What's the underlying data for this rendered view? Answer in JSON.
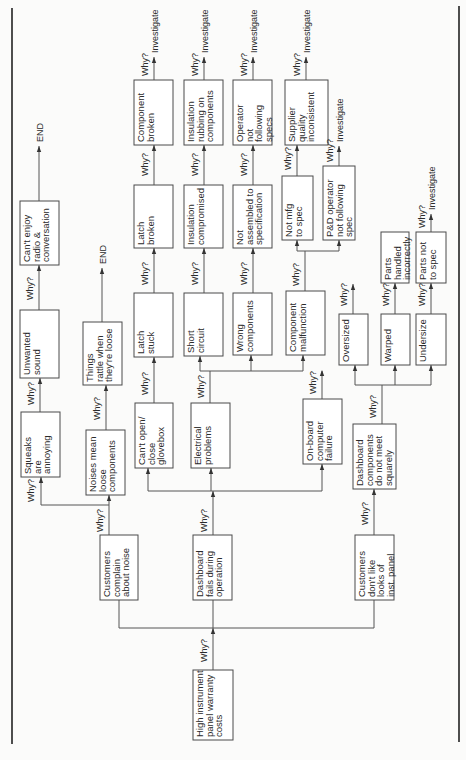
{
  "figure": {
    "why_label": "Why?",
    "colors": {
      "background": "#fbfbfa",
      "line": "#555555",
      "box_border": "#4a4a4a",
      "text": "#2a2a2a"
    },
    "root": {
      "lines": [
        "High instrument",
        "panel warranty",
        "costs"
      ]
    },
    "level1": [
      {
        "id": "noise",
        "lines": [
          "Customers",
          "complain",
          "about noise"
        ]
      },
      {
        "id": "fails",
        "lines": [
          "Dashboard",
          "fails during",
          "operation"
        ]
      },
      {
        "id": "looks",
        "lines": [
          "Customers",
          "don't like",
          "looks of",
          "inst. panel"
        ]
      }
    ],
    "level2": [
      {
        "id": "squeaks",
        "lines": [
          "Squeaks",
          "are",
          "annoying"
        ]
      },
      {
        "id": "noises_loose",
        "lines": [
          "Noises mean",
          "loose",
          "components"
        ]
      },
      {
        "id": "glovebox",
        "lines": [
          "Can't open/",
          "close",
          "glovebox"
        ]
      },
      {
        "id": "electrical",
        "lines": [
          "Electrical",
          "problems"
        ]
      },
      {
        "id": "onboard",
        "lines": [
          "On-board",
          "computer",
          "failure"
        ]
      },
      {
        "id": "squarely",
        "lines": [
          "Dashboard",
          "components",
          "do not meet",
          "squarely"
        ]
      }
    ],
    "level3": [
      {
        "id": "unwanted",
        "lines": [
          "Unwanted",
          "sound"
        ]
      },
      {
        "id": "rattle",
        "lines": [
          "Things",
          "rattle when",
          "they're loose"
        ]
      },
      {
        "id": "latch_stuck",
        "lines": [
          "Latch",
          "stuck"
        ]
      },
      {
        "id": "short",
        "lines": [
          "Short",
          "circuit"
        ]
      },
      {
        "id": "wrong",
        "lines": [
          "Wrong",
          "components"
        ]
      },
      {
        "id": "malfunction",
        "lines": [
          "Component",
          "malfunction"
        ]
      },
      {
        "id": "oversized",
        "lines": [
          "Oversized"
        ]
      },
      {
        "id": "warped",
        "lines": [
          "Warped"
        ]
      },
      {
        "id": "undersize",
        "lines": [
          "Undersize"
        ]
      }
    ],
    "level4": [
      {
        "id": "radio",
        "lines": [
          "Can't enjoy",
          "radio &",
          "conversation"
        ]
      },
      {
        "id": "latch_broken",
        "lines": [
          "Latch",
          "broken"
        ]
      },
      {
        "id": "insulation",
        "lines": [
          "Insulation",
          "compromised"
        ]
      },
      {
        "id": "not_assembled",
        "lines": [
          "Not",
          "assembled to",
          "specification"
        ]
      },
      {
        "id": "not_mfg",
        "lines": [
          "Not mfg",
          "to spec"
        ]
      },
      {
        "id": "pd_operator",
        "lines": [
          "P&D operator",
          "not following",
          "spec"
        ]
      },
      {
        "id": "handled",
        "lines": [
          "Parts",
          "handled",
          "incorrectly"
        ]
      },
      {
        "id": "parts_not_spec",
        "lines": [
          "Parts not",
          "to spec"
        ]
      }
    ],
    "level5": [
      {
        "id": "comp_broken",
        "lines": [
          "Component",
          "broken"
        ]
      },
      {
        "id": "rubbing",
        "lines": [
          "Insulation",
          "rubbing on",
          "components"
        ]
      },
      {
        "id": "operator",
        "lines": [
          "Operator",
          "not",
          "following",
          "specs"
        ]
      },
      {
        "id": "supplier",
        "lines": [
          "Supplier",
          "quality",
          "inconsistent"
        ]
      }
    ],
    "terminals": {
      "end": "END",
      "investigate": "Investigate"
    }
  }
}
